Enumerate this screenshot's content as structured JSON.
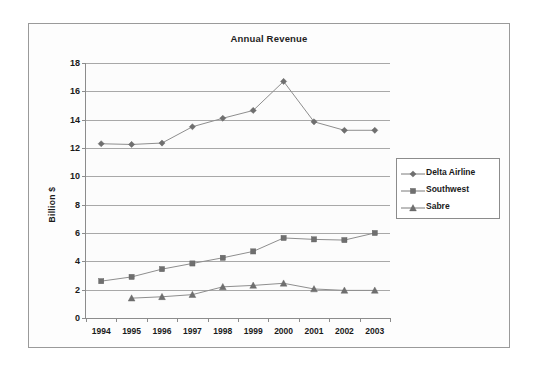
{
  "chart_data": {
    "type": "line",
    "title": "Annual Revenue",
    "xlabel": "",
    "ylabel": "Billion $",
    "categories": [
      "1994",
      "1995",
      "1996",
      "1997",
      "1998",
      "1999",
      "2000",
      "2001",
      "2002",
      "2003"
    ],
    "ylim": [
      0,
      18
    ],
    "ytick_step": 2,
    "yticks": [
      "18",
      "16",
      "14",
      "12",
      "10",
      "8",
      "6",
      "4",
      "2",
      "0"
    ],
    "grid": "horizontal",
    "legend_position": "right",
    "series": [
      {
        "name": "Delta Airline",
        "marker": "diamond",
        "color": "#7a7a7a",
        "values": [
          12.3,
          12.25,
          12.35,
          13.5,
          14.1,
          14.65,
          16.7,
          13.85,
          13.25,
          13.25
        ]
      },
      {
        "name": "Southwest",
        "marker": "square",
        "color": "#7a7a7a",
        "values": [
          2.6,
          2.9,
          3.45,
          3.85,
          4.25,
          4.7,
          5.65,
          5.55,
          5.5,
          6.0
        ]
      },
      {
        "name": "Sabre",
        "marker": "triangle",
        "color": "#7a7a7a",
        "values": [
          null,
          1.4,
          1.5,
          1.65,
          2.2,
          2.3,
          2.45,
          2.05,
          1.95,
          1.95
        ]
      }
    ]
  },
  "colors": {
    "frame_border": "#9a9a9a",
    "axis": "#8c8c8c",
    "gridline": "#a8a8a8",
    "series": "#7a7a7a",
    "text": "#1a1a1a",
    "background": "#ffffff"
  }
}
